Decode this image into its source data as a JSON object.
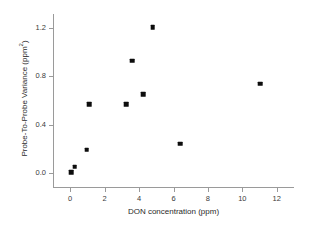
{
  "chart_data": {
    "type": "scatter",
    "title": "",
    "xlabel": "DON concentration (ppm)",
    "ylabel": "Probe-To-Probe Variance (ppm²)",
    "ylabel_base": "Probe-To-Probe Variance (ppm",
    "ylabel_sup": "2",
    "ylabel_tail": ")",
    "xlim": [
      -1.0,
      13.0
    ],
    "ylim": [
      -0.12,
      1.32
    ],
    "grid": false,
    "legend": null,
    "xticks": [
      0,
      2,
      4,
      6,
      8,
      10,
      12
    ],
    "xtick_labels": [
      "0",
      "2",
      "4",
      "6",
      "8",
      "10",
      "12"
    ],
    "yticks": [
      0.0,
      0.4,
      0.8,
      1.2
    ],
    "ytick_labels": [
      "0.0",
      "0.4",
      "0.8",
      "1.2"
    ],
    "marker": "filled-square",
    "marker_color": "#0d0d0d",
    "points": [
      {
        "x": 0.05,
        "y": 0.005
      },
      {
        "x": 0.25,
        "y": 0.05
      },
      {
        "x": 0.95,
        "y": 0.19
      },
      {
        "x": 1.1,
        "y": 0.57
      },
      {
        "x": 3.25,
        "y": 0.57
      },
      {
        "x": 3.6,
        "y": 0.93
      },
      {
        "x": 4.25,
        "y": 0.65
      },
      {
        "x": 4.8,
        "y": 1.21
      },
      {
        "x": 6.4,
        "y": 0.24
      },
      {
        "x": 11.05,
        "y": 0.74
      }
    ]
  },
  "colors": {
    "marker": "#0d0d0d",
    "axis": "#9a9a9a",
    "text": "#2a2a2a",
    "background": "#ffffff"
  }
}
